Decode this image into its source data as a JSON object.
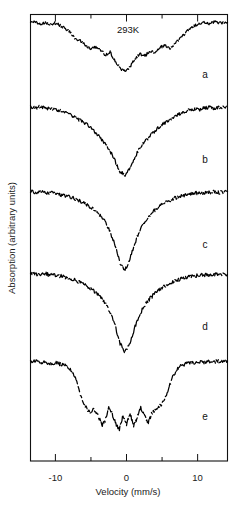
{
  "figure": {
    "background_color": "#ffffff",
    "frame_color": "#111111",
    "trace_color": "#000000",
    "annotation": "293K"
  },
  "axes": {
    "x": {
      "label": "Velocity (mm/s)",
      "min": -13.5,
      "max": 14.2,
      "major_ticks": [
        -10,
        0,
        10
      ],
      "major_tick_labels": [
        "-10",
        "0",
        "10"
      ],
      "minor_ticks": [
        -5,
        5
      ]
    },
    "y": {
      "label": "Absorption (arbitrary units)",
      "ticks": [],
      "tick_labels": []
    }
  },
  "panel_labels": [
    "a",
    "b",
    "c",
    "d",
    "e"
  ],
  "chart_data": {
    "type": "line",
    "title": "",
    "subtitle": "",
    "xlabel": "Velocity (mm/s)",
    "ylabel": "Absorption (arbitrary units)",
    "xlim": [
      -13.5,
      14.2
    ],
    "ylim": [
      0,
      1
    ],
    "grid": false,
    "legend": "none",
    "annotations": [
      {
        "text": "293K",
        "x": 0.0,
        "y_panel": "a",
        "position": "top-center"
      },
      {
        "text": "a",
        "position": "right",
        "panel": 0
      },
      {
        "text": "b",
        "position": "right",
        "panel": 1
      },
      {
        "text": "c",
        "position": "right",
        "panel": 2
      },
      {
        "text": "d",
        "position": "right",
        "panel": 3
      },
      {
        "text": "e",
        "position": "right",
        "panel": 4
      }
    ],
    "series": [
      {
        "name": "a",
        "baseline": 0.0,
        "depth": 0.82,
        "shape": "broad-structured-doublet",
        "x": [
          -13.5,
          -12.8,
          -12.1,
          -11.4,
          -10.7,
          -10.0,
          -9.3,
          -8.6,
          -7.9,
          -7.2,
          -6.5,
          -5.8,
          -5.1,
          -4.4,
          -3.7,
          -3.0,
          -2.3,
          -1.6,
          -0.9,
          -0.2,
          0.5,
          1.2,
          1.9,
          2.6,
          3.3,
          4.0,
          4.7,
          5.4,
          6.1,
          6.8,
          7.5,
          8.2,
          8.9,
          9.6,
          10.3,
          11.0,
          11.7,
          12.4,
          13.1,
          14.2
        ],
        "y": [
          0.05,
          0.03,
          0.06,
          0.04,
          0.07,
          0.05,
          0.09,
          0.14,
          0.2,
          0.3,
          0.33,
          0.41,
          0.46,
          0.44,
          0.47,
          0.57,
          0.52,
          0.66,
          0.78,
          0.82,
          0.76,
          0.62,
          0.55,
          0.58,
          0.5,
          0.52,
          0.44,
          0.41,
          0.46,
          0.38,
          0.3,
          0.22,
          0.14,
          0.09,
          0.06,
          0.04,
          0.06,
          0.03,
          0.05,
          0.04
        ]
      },
      {
        "name": "b",
        "baseline": 0.0,
        "depth": 0.95,
        "shape": "broad-singlet",
        "x": [
          -13.5,
          -12.8,
          -12.1,
          -11.4,
          -10.7,
          -10.0,
          -9.3,
          -8.6,
          -7.9,
          -7.2,
          -6.5,
          -5.8,
          -5.1,
          -4.4,
          -3.7,
          -3.0,
          -2.3,
          -1.6,
          -0.9,
          -0.2,
          0.5,
          1.2,
          1.9,
          2.6,
          3.3,
          4.0,
          4.7,
          5.4,
          6.1,
          6.8,
          7.5,
          8.2,
          8.9,
          9.6,
          10.3,
          11.0,
          11.7,
          12.4,
          13.1,
          14.2
        ],
        "y": [
          0.03,
          0.04,
          0.02,
          0.05,
          0.04,
          0.07,
          0.08,
          0.11,
          0.13,
          0.17,
          0.21,
          0.25,
          0.3,
          0.37,
          0.44,
          0.52,
          0.62,
          0.76,
          0.9,
          0.95,
          0.84,
          0.7,
          0.58,
          0.49,
          0.42,
          0.35,
          0.29,
          0.24,
          0.19,
          0.15,
          0.12,
          0.09,
          0.07,
          0.05,
          0.06,
          0.04,
          0.03,
          0.05,
          0.03,
          0.04
        ]
      },
      {
        "name": "c",
        "baseline": 0.0,
        "depth": 1.0,
        "shape": "narrow-singlet",
        "x": [
          -13.5,
          -12.8,
          -12.1,
          -11.4,
          -10.7,
          -10.0,
          -9.3,
          -8.6,
          -7.9,
          -7.2,
          -6.5,
          -5.8,
          -5.1,
          -4.4,
          -3.7,
          -3.0,
          -2.3,
          -1.6,
          -0.9,
          -0.2,
          0.5,
          1.2,
          1.9,
          2.6,
          3.3,
          4.0,
          4.7,
          5.4,
          6.1,
          6.8,
          7.5,
          8.2,
          8.9,
          9.6,
          10.3,
          11.0,
          11.7,
          12.4,
          13.1,
          14.2
        ],
        "y": [
          0.02,
          0.03,
          0.02,
          0.04,
          0.03,
          0.05,
          0.06,
          0.07,
          0.09,
          0.11,
          0.14,
          0.17,
          0.21,
          0.26,
          0.32,
          0.4,
          0.52,
          0.7,
          0.92,
          1.0,
          0.86,
          0.66,
          0.5,
          0.39,
          0.31,
          0.25,
          0.2,
          0.16,
          0.13,
          0.1,
          0.08,
          0.07,
          0.05,
          0.04,
          0.04,
          0.03,
          0.03,
          0.02,
          0.03,
          0.02
        ]
      },
      {
        "name": "d",
        "baseline": 0.0,
        "depth": 1.0,
        "shape": "narrow-singlet",
        "x": [
          -13.5,
          -12.8,
          -12.1,
          -11.4,
          -10.7,
          -10.0,
          -9.3,
          -8.6,
          -7.9,
          -7.2,
          -6.5,
          -5.8,
          -5.1,
          -4.4,
          -3.7,
          -3.0,
          -2.3,
          -1.6,
          -0.9,
          -0.2,
          0.5,
          1.2,
          1.9,
          2.6,
          3.3,
          4.0,
          4.7,
          5.4,
          6.1,
          6.8,
          7.5,
          8.2,
          8.9,
          9.6,
          10.3,
          11.0,
          11.7,
          12.4,
          13.1,
          14.2
        ],
        "y": [
          0.02,
          0.03,
          0.03,
          0.02,
          0.04,
          0.04,
          0.05,
          0.07,
          0.08,
          0.1,
          0.13,
          0.16,
          0.2,
          0.25,
          0.31,
          0.39,
          0.5,
          0.67,
          0.9,
          1.0,
          0.88,
          0.68,
          0.52,
          0.41,
          0.33,
          0.27,
          0.22,
          0.17,
          0.14,
          0.11,
          0.09,
          0.07,
          0.06,
          0.05,
          0.04,
          0.04,
          0.03,
          0.03,
          0.02,
          0.03
        ]
      },
      {
        "name": "e",
        "baseline": 0.0,
        "depth": 0.95,
        "shape": "sextet",
        "sextet_line_positions": [
          -5.2,
          -3.0,
          -1.0,
          1.0,
          3.0,
          5.2
        ],
        "x": [
          -13.5,
          -12.8,
          -12.1,
          -11.4,
          -10.7,
          -10.0,
          -9.3,
          -8.6,
          -7.9,
          -7.2,
          -6.5,
          -5.8,
          -5.2,
          -4.6,
          -4.0,
          -3.4,
          -3.0,
          -2.5,
          -2.0,
          -1.5,
          -1.0,
          -0.5,
          0.0,
          0.5,
          1.0,
          1.5,
          2.0,
          2.5,
          3.0,
          3.5,
          4.0,
          4.6,
          5.2,
          5.8,
          6.5,
          7.2,
          7.9,
          8.6,
          9.3,
          10.0,
          10.7,
          11.4,
          12.1,
          12.8,
          13.5,
          14.2
        ],
        "y": [
          0.05,
          0.04,
          0.06,
          0.05,
          0.07,
          0.06,
          0.08,
          0.1,
          0.14,
          0.26,
          0.46,
          0.62,
          0.7,
          0.66,
          0.74,
          0.86,
          0.8,
          0.62,
          0.72,
          0.84,
          0.92,
          0.74,
          0.86,
          0.7,
          0.88,
          0.76,
          0.64,
          0.74,
          0.84,
          0.72,
          0.66,
          0.62,
          0.56,
          0.42,
          0.24,
          0.13,
          0.09,
          0.07,
          0.06,
          0.05,
          0.06,
          0.04,
          0.05,
          0.04,
          0.05,
          0.04
        ]
      }
    ]
  }
}
